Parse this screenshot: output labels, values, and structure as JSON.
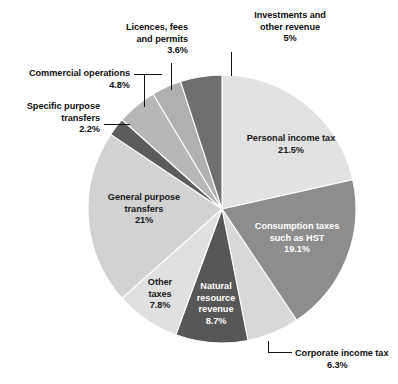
{
  "chart_data": {
    "type": "pie",
    "title": "",
    "subtitle": "",
    "xlabel": "",
    "ylabel": "",
    "legend_position": "none",
    "grid": false,
    "units": "percent",
    "start_angle_deg": 0,
    "direction": "clockwise",
    "categories": [
      "Personal income tax",
      "Consumption taxes such as HST",
      "Corporate income tax",
      "Natural resource revenue",
      "Other taxes",
      "General purpose transfers",
      "Specific purpose transfers",
      "Commercial operations",
      "Licences, fees and permits",
      "Investments and other revenue"
    ],
    "values": [
      21.5,
      19.1,
      6.3,
      8.7,
      7.8,
      21,
      2.2,
      4.8,
      3.6,
      5
    ],
    "value_labels": [
      "21.5%",
      "19.1%",
      "6.3%",
      "8.7%",
      "7.8%",
      "21%",
      "2.2%",
      "4.8%",
      "3.6%",
      "5%"
    ],
    "colors": [
      "#e2e2e2",
      "#8d8d8d",
      "#d9d9d9",
      "#575757",
      "#e0e0e0",
      "#d2d2d2",
      "#5c5c5c",
      "#b7b7b7",
      "#b0b0b0",
      "#6f6f6f"
    ],
    "slices": [
      {
        "name": "personal-income-tax",
        "label": "Personal income tax",
        "value": 21.5,
        "value_label": "21.5%",
        "color": "#e2e2e2",
        "label_placement": "inside"
      },
      {
        "name": "consumption-taxes",
        "label": "Consumption taxes",
        "label_line2": "such as HST",
        "value": 19.1,
        "value_label": "19.1%",
        "color": "#8d8d8d",
        "label_placement": "inside"
      },
      {
        "name": "corporate-income-tax",
        "label": "Corporate income tax",
        "value": 6.3,
        "value_label": "6.3%",
        "color": "#d9d9d9",
        "label_placement": "outside"
      },
      {
        "name": "natural-resource-revenue",
        "label": "Natural",
        "label_line2": "resource",
        "label_line3": "revenue",
        "value": 8.7,
        "value_label": "8.7%",
        "color": "#575757",
        "label_placement": "inside"
      },
      {
        "name": "other-taxes",
        "label": "Other",
        "label_line2": "taxes",
        "value": 7.8,
        "value_label": "7.8%",
        "color": "#e0e0e0",
        "label_placement": "inside"
      },
      {
        "name": "general-purpose-transfers",
        "label": "General purpose",
        "label_line2": "transfers",
        "value": 21,
        "value_label": "21%",
        "color": "#d2d2d2",
        "label_placement": "inside"
      },
      {
        "name": "specific-purpose-transfers",
        "label": "Specific purpose",
        "label_line2": "transfers",
        "value": 2.2,
        "value_label": "2.2%",
        "color": "#5c5c5c",
        "label_placement": "outside"
      },
      {
        "name": "commercial-operations",
        "label": "Commercial operations",
        "value": 4.8,
        "value_label": "4.8%",
        "color": "#b7b7b7",
        "label_placement": "outside"
      },
      {
        "name": "licences-fees-and-permits",
        "label": "Licences, fees",
        "label_line2": "and permits",
        "value": 3.6,
        "value_label": "3.6%",
        "color": "#b0b0b0",
        "label_placement": "outside"
      },
      {
        "name": "investments-and-other-revenue",
        "label": "Investments and",
        "label_line2": "other revenue",
        "value": 5,
        "value_label": "5%",
        "color": "#6f6f6f",
        "label_placement": "outside"
      }
    ]
  },
  "labels": {
    "personal_income_tax": {
      "line1": "Personal income tax",
      "pct": "21.5%"
    },
    "consumption_taxes": {
      "line1": "Consumption taxes",
      "line2": "such as HST",
      "pct": "19.1%"
    },
    "corporate_income_tax": {
      "line1": "Corporate income tax",
      "pct": "6.3%"
    },
    "natural_resource_revenue": {
      "line1": "Natural",
      "line2": "resource",
      "line3": "revenue",
      "pct": "8.7%"
    },
    "other_taxes": {
      "line1": "Other",
      "line2": "taxes",
      "pct": "7.8%"
    },
    "general_purpose_transfers": {
      "line1": "General purpose",
      "line2": "transfers",
      "pct": "21%"
    },
    "specific_purpose_transfers": {
      "line1": "Specific purpose",
      "line2": "transfers",
      "pct": "2.2%"
    },
    "commercial_operations": {
      "line1": "Commercial operations",
      "pct": "4.8%"
    },
    "licences_fees_permits": {
      "line1": "Licences, fees",
      "line2": "and permits",
      "pct": "3.6%"
    },
    "investments_other_revenue": {
      "line1": "Investments and",
      "line2": "other revenue",
      "pct": "5%"
    }
  },
  "geometry": {
    "center_x": 222,
    "center_y": 209,
    "radius": 134
  }
}
